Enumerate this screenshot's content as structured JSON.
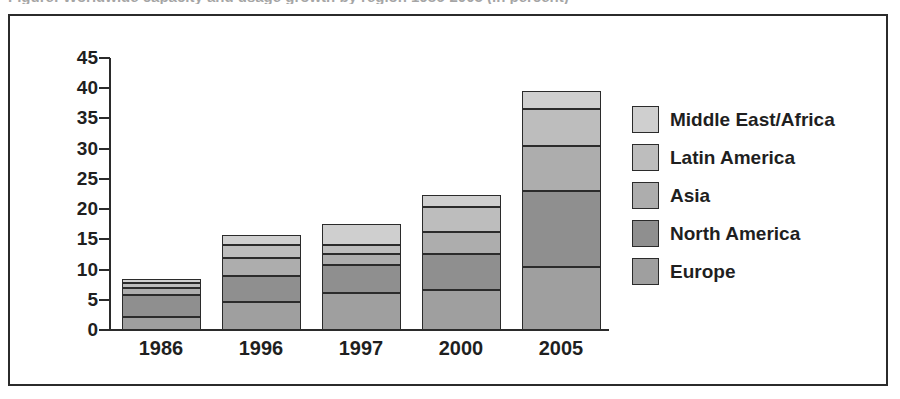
{
  "caption": {
    "text": "Figure: Worldwide capacity and usage growth by region 1986-2005 (in percent)"
  },
  "chart_data": {
    "type": "bar",
    "stacked": true,
    "title": "",
    "subtitle": "",
    "xlabel": "",
    "ylabel": "",
    "categories": [
      "1986",
      "1996",
      "1997",
      "2000",
      "2005"
    ],
    "ylim": [
      0,
      45
    ],
    "yticks": [
      0,
      5,
      10,
      15,
      20,
      25,
      30,
      35,
      40,
      45
    ],
    "ytick_labels": [
      "0",
      "5",
      "10",
      "15",
      "20",
      "25",
      "30",
      "35",
      "40",
      "45"
    ],
    "grid": false,
    "legend_position": "right",
    "legend_order_top_to_bottom": [
      "Middle East/Africa",
      "Latin America",
      "Asia",
      "North America",
      "Europe"
    ],
    "series": [
      {
        "name": "Europe",
        "color": "#9f9f9f",
        "values": [
          2.2,
          4.7,
          6.1,
          6.6,
          10.5
        ]
      },
      {
        "name": "North America",
        "color": "#8f8f8f",
        "values": [
          3.6,
          4.2,
          4.6,
          5.9,
          12.5
        ]
      },
      {
        "name": "Asia",
        "color": "#adadad",
        "values": [
          1.2,
          3.0,
          1.8,
          3.7,
          7.5
        ]
      },
      {
        "name": "Latin America",
        "color": "#bdbdbd",
        "values": [
          0.8,
          2.2,
          1.6,
          4.2,
          6.0
        ]
      },
      {
        "name": "Middle East/Africa",
        "color": "#cfcfcf",
        "values": [
          0.7,
          1.6,
          3.4,
          2.0,
          3.0
        ]
      }
    ],
    "totals": [
      8.5,
      15.7,
      17.5,
      22.4,
      39.5
    ]
  },
  "colors": {
    "outline": "#2b2b2b",
    "text": "#1f1f1f",
    "background": "#ffffff"
  }
}
